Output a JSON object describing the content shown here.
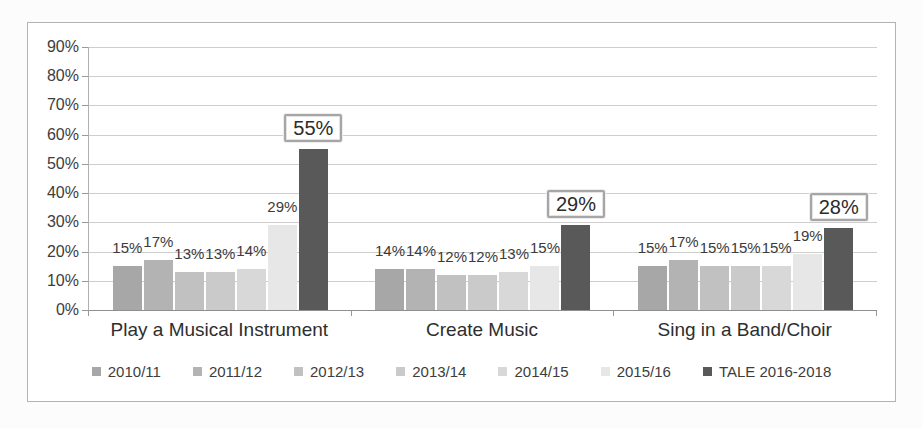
{
  "chart_data": {
    "type": "bar",
    "title": "",
    "categories": [
      "Play a Musical Instrument",
      "Create Music",
      "Sing in a Band/Choir"
    ],
    "series": [
      {
        "name": "2010/11",
        "color": "#a7a7a7",
        "values": [
          15,
          14,
          15
        ]
      },
      {
        "name": "2011/12",
        "color": "#b3b3b3",
        "values": [
          17,
          14,
          17
        ]
      },
      {
        "name": "2012/13",
        "color": "#c1c1c1",
        "values": [
          13,
          12,
          15
        ]
      },
      {
        "name": "2013/14",
        "color": "#cacaca",
        "values": [
          13,
          12,
          15
        ]
      },
      {
        "name": "2014/15",
        "color": "#d8d8d8",
        "values": [
          14,
          13,
          15
        ]
      },
      {
        "name": "2015/16",
        "color": "#e7e7e7",
        "values": [
          29,
          15,
          19
        ]
      },
      {
        "name": "TALE 2016-2018",
        "color": "#595959",
        "values": [
          55,
          29,
          28
        ],
        "boxed_labels": true
      }
    ],
    "y_axis": {
      "min": 0,
      "max": 90,
      "step": 10,
      "tick_labels": [
        "0%",
        "10%",
        "20%",
        "30%",
        "40%",
        "50%",
        "60%",
        "70%",
        "80%",
        "90%"
      ]
    },
    "data_label_format": "percent",
    "legend_position": "bottom",
    "grid": true
  },
  "colors": {
    "grid_line": "#cecece",
    "axis_line": "#8f8f8f",
    "tick_line": "#9a9a9a",
    "text": "#3d3d3d",
    "frame_border": "#b3b3b3",
    "callout_border": "#a6a6a6",
    "background": "#ffffff"
  }
}
